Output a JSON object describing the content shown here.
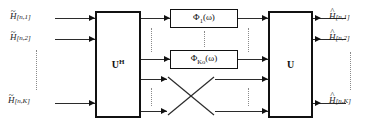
{
  "diagram": {
    "width": 373,
    "height": 130,
    "line_color": "#2b2b2b",
    "dot_color": "#8a8a8a"
  },
  "inputs": [
    {
      "base": "H",
      "accent": "~",
      "index": "[n,1]"
    },
    {
      "base": "H",
      "accent": "~",
      "index": "[n,2]"
    },
    {
      "base": "H",
      "accent": "~",
      "index": "[n,K]"
    }
  ],
  "outputs": [
    {
      "base": "H",
      "accent": "^",
      "index": "[n,1]"
    },
    {
      "base": "H",
      "accent": "^",
      "index": "[n,2]"
    },
    {
      "base": "H",
      "accent": "^",
      "index": "[n,K]"
    }
  ],
  "blocks": {
    "analysis": {
      "label": "U",
      "superscript": "H"
    },
    "synthesis": {
      "label": "U",
      "superscript": ""
    }
  },
  "filters": [
    {
      "symbol": "Φ",
      "subscript": "1",
      "arg": "(ω)"
    },
    {
      "symbol": "Φ",
      "subscript": "Ko",
      "arg": "(ω)"
    }
  ],
  "ellipsis": {
    "input_gap": "vertical-dots",
    "mid_gap": "vertical-dots",
    "output_gap": "vertical-dots"
  },
  "crossing": {
    "name": "x-crossover",
    "描述": "diagonal crossed paths"
  }
}
